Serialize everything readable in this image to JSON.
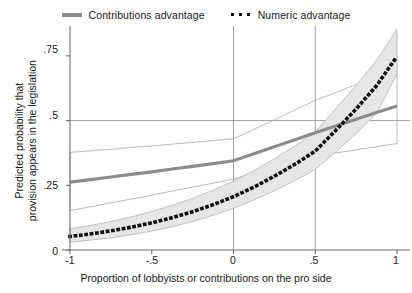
{
  "chart_data": {
    "type": "line",
    "title": "",
    "xlabel": "Proportion of lobbyists or contributions on the pro side",
    "ylabel": "Predicted probability that provision appears in the legislation",
    "ylabel_line1": "Predicted probability that",
    "ylabel_line2": "provision appears in the legislation",
    "xlim": [
      -1,
      1
    ],
    "ylim": [
      0,
      0.85
    ],
    "xticks": [
      -1,
      -0.5,
      0,
      0.5,
      1
    ],
    "xticklabels": [
      "-1",
      "-.5",
      "0",
      ".5",
      "1"
    ],
    "yticks": [
      0,
      0.25,
      0.5,
      0.75
    ],
    "yticklabels": [
      "0",
      ".25",
      ".5",
      ".75"
    ],
    "grid": false,
    "reference_lines": {
      "vertical_x": [
        0,
        0.5
      ],
      "horizontal_y": [
        0.5
      ]
    },
    "legend": {
      "position": "top-center",
      "entries": [
        {
          "label": "Contributions advantage",
          "marker": "solid-line",
          "color": "#8c8c8c"
        },
        {
          "label": "Numeric advantage",
          "marker": "dotted-line",
          "color": "#111111"
        }
      ]
    },
    "x": [
      -1,
      -0.875,
      -0.75,
      -0.625,
      -0.5,
      -0.375,
      -0.25,
      -0.125,
      0,
      0.125,
      0.25,
      0.375,
      0.5,
      0.625,
      0.75,
      0.875,
      1
    ],
    "series": [
      {
        "name": "Contributions advantage",
        "style": "solid",
        "color": "#8c8c8c",
        "values": [
          0.262,
          0.272,
          0.282,
          0.292,
          0.302,
          0.313,
          0.323,
          0.334,
          0.345,
          0.372,
          0.399,
          0.426,
          0.453,
          0.479,
          0.505,
          0.531,
          0.556
        ],
        "ci_lower": [
          0.152,
          0.167,
          0.182,
          0.197,
          0.212,
          0.228,
          0.243,
          0.258,
          0.274,
          0.297,
          0.319,
          0.341,
          0.363,
          0.375,
          0.387,
          0.399,
          0.411
        ],
        "ci_upper": [
          0.377,
          0.383,
          0.389,
          0.396,
          0.402,
          0.409,
          0.416,
          0.423,
          0.43,
          0.466,
          0.503,
          0.541,
          0.578,
          0.608,
          0.639,
          0.67,
          0.7
        ],
        "ci_fill": "none",
        "ci_outline": "#a8a8a8"
      },
      {
        "name": "Numeric advantage",
        "style": "dotted",
        "color": "#111111",
        "values": [
          0.052,
          0.062,
          0.074,
          0.088,
          0.105,
          0.125,
          0.148,
          0.175,
          0.206,
          0.243,
          0.285,
          0.331,
          0.382,
          0.462,
          0.545,
          0.635,
          0.748
        ],
        "ci_lower": [
          0.03,
          0.038,
          0.047,
          0.059,
          0.073,
          0.09,
          0.11,
          0.134,
          0.161,
          0.193,
          0.229,
          0.268,
          0.311,
          0.379,
          0.45,
          0.527,
          0.68
        ],
        "ci_upper": [
          0.082,
          0.095,
          0.11,
          0.128,
          0.149,
          0.173,
          0.2,
          0.231,
          0.266,
          0.307,
          0.352,
          0.402,
          0.456,
          0.546,
          0.636,
          0.733,
          0.852
        ],
        "ci_fill": "#e6e6e6",
        "ci_outline": "#b4b4b4"
      }
    ]
  },
  "axes": {
    "axis_color": "#6e6e6e",
    "reference_line_color": "#8a8a8a"
  }
}
